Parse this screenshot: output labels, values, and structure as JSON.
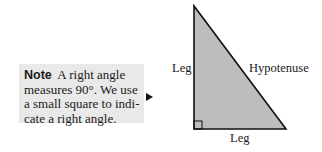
{
  "note": {
    "label": "Note",
    "lines": [
      "A right angle",
      "measures 90°. We use",
      "a small square to indi-",
      "cate a right angle."
    ]
  },
  "figure": {
    "labels": {
      "left_leg": "Leg",
      "bottom_leg": "Leg",
      "hypotenuse": "Hypotenuse"
    },
    "colors": {
      "fill": "#bdbdbd",
      "stroke": "#111111",
      "note_bg": "#e9e9e9"
    }
  }
}
